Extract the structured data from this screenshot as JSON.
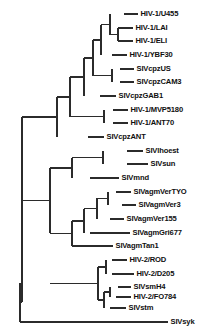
{
  "figure": {
    "background_color": "#ffffff",
    "line_color": "#2b2b2b",
    "label_color": "#101010"
  },
  "chart_data": {
    "type": "tree",
    "title": "",
    "xlabel": "",
    "ylabel": "",
    "grid": false,
    "legend": "none",
    "orientation": "left-to-right-rectangular-cladogram",
    "leaf_count": 22,
    "leaves": [
      {
        "id": "hiv1-u455",
        "label": "HIV-1/U455",
        "y": 14,
        "x_start": 124,
        "x_end": 138
      },
      {
        "id": "hiv1-lai",
        "label": "HIV-1/LAI",
        "y": 28,
        "x_start": 118,
        "x_end": 133
      },
      {
        "id": "hiv1-eli",
        "label": "HIV-1/ELI",
        "y": 41,
        "x_start": 118,
        "x_end": 133
      },
      {
        "id": "hiv1-ybf30",
        "label": "HIV-1/YBF30",
        "y": 55,
        "x_start": 112,
        "x_end": 127
      },
      {
        "id": "sivcpzus",
        "label": "SIVcpzUS",
        "y": 69,
        "x_start": 120,
        "x_end": 134
      },
      {
        "id": "sivcpzcam3",
        "label": "SIVcpzCAM3",
        "y": 82,
        "x_start": 120,
        "x_end": 134
      },
      {
        "id": "sivcpzgab1",
        "label": "SIVcpzGAB1",
        "y": 96,
        "x_start": 100,
        "x_end": 116
      },
      {
        "id": "hiv1-mvp5180",
        "label": "HIV-1/MVP5180",
        "y": 110,
        "x_start": 113,
        "x_end": 128
      },
      {
        "id": "hiv1-ant70",
        "label": "HIV-1/ANT70",
        "y": 123,
        "x_start": 113,
        "x_end": 128
      },
      {
        "id": "sivcpzant",
        "label": "SIVcpzANT",
        "y": 137,
        "x_start": 88,
        "x_end": 104
      },
      {
        "id": "sivlhoest",
        "label": "SIVlhoest",
        "y": 151,
        "x_start": 127,
        "x_end": 143
      },
      {
        "id": "sivsun",
        "label": "SIVsun",
        "y": 164,
        "x_start": 127,
        "x_end": 148
      },
      {
        "id": "sivmnd",
        "label": "SIVmnd",
        "y": 178,
        "x_start": 90,
        "x_end": 119
      },
      {
        "id": "sivagmvertyo",
        "label": "SIVagmVerTYO",
        "y": 192,
        "x_start": 116,
        "x_end": 131
      },
      {
        "id": "sivagmver3",
        "label": "SIVagmVer3",
        "y": 205,
        "x_start": 122,
        "x_end": 136
      },
      {
        "id": "sivagmver155",
        "label": "SIVagmVer155",
        "y": 219,
        "x_start": 110,
        "x_end": 124
      },
      {
        "id": "sivagmgri677",
        "label": "SIVagmGri677",
        "y": 233,
        "x_start": 90,
        "x_end": 130
      },
      {
        "id": "sivagmtan1",
        "label": "SIVagmTan1",
        "y": 246,
        "x_start": 72,
        "x_end": 113
      },
      {
        "id": "hiv2-rod",
        "label": "HIV-2/ROD",
        "y": 260,
        "x_start": 112,
        "x_end": 127
      },
      {
        "id": "hiv2-d205",
        "label": "HIV-2/D205",
        "y": 274,
        "x_start": 112,
        "x_end": 134
      },
      {
        "id": "sivsmh4",
        "label": "SIVsmH4",
        "y": 287,
        "x_start": 118,
        "x_end": 131
      },
      {
        "id": "hiv2-fo784",
        "label": "HIV-2/FO784",
        "y": 297,
        "x_start": 116,
        "x_end": 131
      },
      {
        "id": "sivstm",
        "label": "SIVstm",
        "y": 308,
        "x_start": 110,
        "x_end": 126
      },
      {
        "id": "sivsyk",
        "label": "SIVsyk",
        "y": 322,
        "x_start": 20,
        "x_end": 168
      }
    ],
    "internal_nodes": [
      {
        "id": "n-hiv1-lai-eli",
        "x": 118,
        "y_top": 28,
        "y_bottom": 41,
        "parent_x": 110
      },
      {
        "id": "n-hiv1-m",
        "x": 110,
        "y_top": 14,
        "y_bottom": 35,
        "parent_x": 101
      },
      {
        "id": "n-hiv1-m-ybf30",
        "x": 101,
        "y_top": 25,
        "y_bottom": 55,
        "parent_x": 93
      },
      {
        "id": "n-sivcpz-us-cam3",
        "x": 112,
        "y_top": 69,
        "y_bottom": 82,
        "parent_x": 93
      },
      {
        "id": "n-hiv1m-cpzus",
        "x": 93,
        "y_top": 40,
        "y_bottom": 76,
        "parent_x": 84
      },
      {
        "id": "n-plus-gab1",
        "x": 84,
        "y_top": 58,
        "y_bottom": 96,
        "parent_x": 70
      },
      {
        "id": "n-hiv1-o",
        "x": 104,
        "y_top": 110,
        "y_bottom": 123,
        "parent_x": 70
      },
      {
        "id": "n-cpz-clade",
        "x": 70,
        "y_top": 77,
        "y_bottom": 117,
        "parent_x": 57
      },
      {
        "id": "n-cpz-ant-join",
        "x": 57,
        "y_top": 97,
        "y_bottom": 137,
        "parent_x": 22
      },
      {
        "id": "n-lhoest-sun",
        "x": 103,
        "y_top": 151,
        "y_bottom": 164,
        "parent_x": 72
      },
      {
        "id": "n-lhoest-mnd",
        "x": 72,
        "y_top": 158,
        "y_bottom": 178,
        "parent_x": 50
      },
      {
        "id": "n-agm-tyo-ver3",
        "x": 108,
        "y_top": 192,
        "y_bottom": 205,
        "parent_x": 97
      },
      {
        "id": "n-agm-ver",
        "x": 97,
        "y_top": 198,
        "y_bottom": 219,
        "parent_x": 84
      },
      {
        "id": "n-agm-ver-gri",
        "x": 84,
        "y_top": 209,
        "y_bottom": 233,
        "parent_x": 72
      },
      {
        "id": "n-agm-all",
        "x": 72,
        "y_top": 221,
        "y_bottom": 246,
        "parent_x": 50
      },
      {
        "id": "n-lhoest-agm",
        "x": 50,
        "y_top": 168,
        "y_bottom": 233,
        "parent_x": 22
      },
      {
        "id": "n-hiv2-rod-d205",
        "x": 106,
        "y_top": 260,
        "y_bottom": 274,
        "parent_x": 98
      },
      {
        "id": "n-sm-fo784",
        "x": 110,
        "y_top": 287,
        "y_bottom": 297,
        "parent_x": 104
      },
      {
        "id": "n-sm-stm",
        "x": 104,
        "y_top": 292,
        "y_bottom": 308,
        "parent_x": 98
      },
      {
        "id": "n-hiv2-sm",
        "x": 98,
        "y_top": 267,
        "y_bottom": 300,
        "parent_x": 50
      },
      {
        "id": "n-hiv2-syk",
        "x": 20,
        "y_top": 283,
        "y_bottom": 322,
        "parent_x": 22
      },
      {
        "id": "n-root",
        "x": 22,
        "y_top": 117,
        "y_bottom": 302,
        "parent_x": 22
      }
    ],
    "groups": [
      {
        "name": "HIV-1/SIVcpz",
        "members": [
          "HIV-1/U455",
          "HIV-1/LAI",
          "HIV-1/ELI",
          "HIV-1/YBF30",
          "SIVcpzUS",
          "SIVcpzCAM3",
          "SIVcpzGAB1",
          "HIV-1/MVP5180",
          "HIV-1/ANT70",
          "SIVcpzANT"
        ]
      },
      {
        "name": "SIVlhoest/SIVsun/SIVmnd",
        "members": [
          "SIVlhoest",
          "SIVsun",
          "SIVmnd"
        ]
      },
      {
        "name": "SIVagm",
        "members": [
          "SIVagmVerTYO",
          "SIVagmVer3",
          "SIVagmVer155",
          "SIVagmGri677",
          "SIVagmTan1"
        ]
      },
      {
        "name": "HIV-2/SIVsm",
        "members": [
          "HIV-2/ROD",
          "HIV-2/D205",
          "SIVsmH4",
          "HIV-2/FO784",
          "SIVstm"
        ]
      },
      {
        "name": "SIVsyk",
        "members": [
          "SIVsyk"
        ]
      }
    ]
  }
}
